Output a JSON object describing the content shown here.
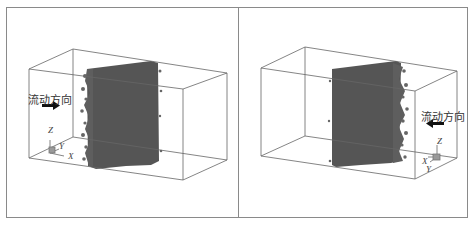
{
  "figure": {
    "frame_color": "#8a8a8a",
    "box_line_color": "#666666",
    "particle_color": "#555555",
    "panels": [
      {
        "id": "left",
        "flow_label": "流动方向",
        "flow_direction": "right",
        "arrow_icon": "arrow-right-icon",
        "axes": {
          "z": "Z",
          "y": "Y",
          "x": "X"
        }
      },
      {
        "id": "right",
        "flow_label": "流动方向",
        "flow_direction": "left",
        "arrow_icon": "arrow-left-icon",
        "axes": {
          "z": "Z",
          "x": "X",
          "y": "Y"
        }
      }
    ]
  }
}
